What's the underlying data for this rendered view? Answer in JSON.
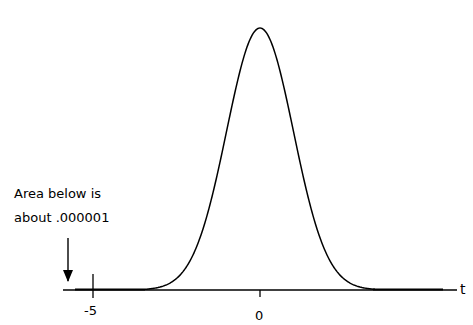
{
  "chart_data": {
    "type": "line",
    "title": "",
    "xlabel": "t",
    "ylabel": "",
    "x_ticks": [
      -5,
      0
    ],
    "x_tick_labels": [
      "-5",
      "0"
    ],
    "xlim": [
      -5.9,
      5.9
    ],
    "ylim": [
      0,
      0.4
    ],
    "grid": false,
    "legend": null,
    "series": [
      {
        "name": "density",
        "x": [
          -5,
          -4,
          -3,
          -2.5,
          -2,
          -1.5,
          -1,
          -0.5,
          0,
          0.5,
          1,
          1.5,
          2,
          2.5,
          3,
          4,
          5
        ],
        "y": [
          1.5e-06,
          0.0001,
          0.0044,
          0.0175,
          0.054,
          0.1295,
          0.242,
          0.352,
          0.399,
          0.352,
          0.242,
          0.1295,
          0.054,
          0.0175,
          0.0044,
          0.0001,
          1.5e-06
        ]
      }
    ],
    "annotations": [
      {
        "text": "Area below is about .000001",
        "points_to_x": -5.75,
        "arrow": "down"
      }
    ]
  },
  "labels": {
    "annotation_line1": "Area below is",
    "annotation_line2": "about .000001",
    "tick_neg5": "-5",
    "tick_0": "0",
    "axis_t": "t"
  },
  "colors": {
    "line": "#000000",
    "background": "#ffffff"
  }
}
